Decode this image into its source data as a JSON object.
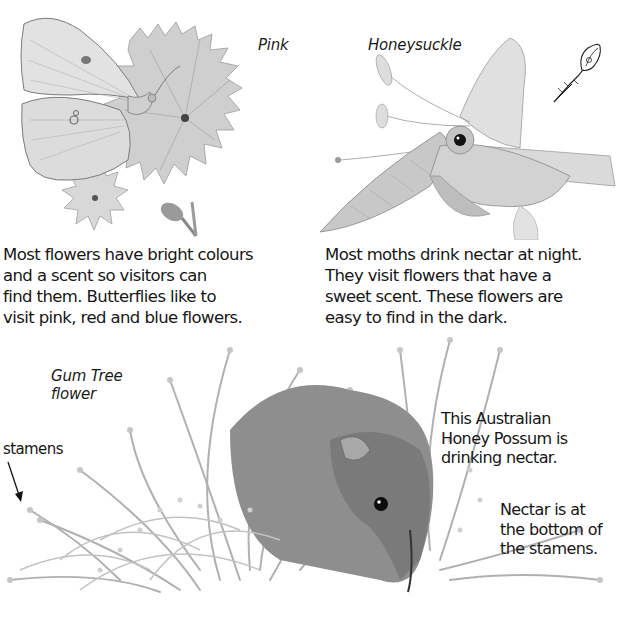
{
  "page": {
    "background": "#ffffff",
    "style": "grayscale illustrated natural history book page"
  },
  "illustrations": {
    "butterfly_pink": {
      "label": "Pink",
      "subject": "butterfly-on-pink-flower"
    },
    "moth_honeysuckle": {
      "label": "Honeysuckle",
      "subject": "hawk-moth-on-honeysuckle"
    },
    "possum_gumtree": {
      "label": "Gum Tree\nflower",
      "subject": "honey-possum-in-gum-tree-flower"
    }
  },
  "captions": {
    "butterflies": "Most flowers have bright colours\nand a scent so visitors can\nfind them. Butterflies like to\nvisit pink, red and blue flowers.",
    "moths": "Most moths drink nectar at night.\nThey visit flowers that have a\nsweet scent. These flowers are\neasy to find in the dark.",
    "possum": "This Australian\nHoney Possum is\ndrinking nectar.",
    "nectar": "Nectar is at\nthe bottom of\nthe stamens.",
    "stamens_pointer": "stamens",
    "cut_off_line": "... of food. They ..."
  },
  "icons": {
    "stamens_arrow": "arrow-down-right-icon",
    "honeysuckle_bud": "flower-bud-sketch-icon"
  }
}
